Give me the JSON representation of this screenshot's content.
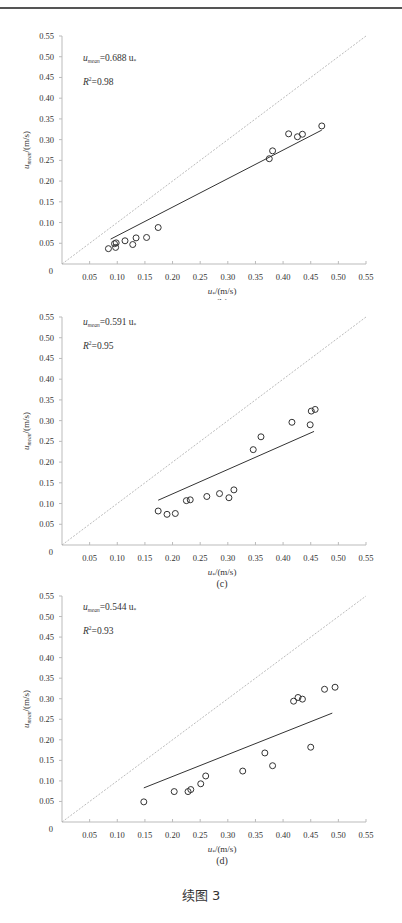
{
  "page": {
    "figure_caption": "续图 3"
  },
  "chart_data": [
    {
      "type": "scatter",
      "panel": "(b)",
      "title": "",
      "xlabel": "u*/(m/s)",
      "ylabel": "u_mean/(m/s)",
      "xlim": [
        0,
        0.55
      ],
      "ylim": [
        0,
        0.55
      ],
      "x_ticks": [
        "0.05",
        "0.10",
        "0.15",
        "0.20",
        "0.25",
        "0.30",
        "0.35",
        "0.40",
        "0.45",
        "0.50",
        "0.55"
      ],
      "y_ticks": [
        "0",
        "0.05",
        "0.10",
        "0.15",
        "0.20",
        "0.25",
        "0.30",
        "0.35",
        "0.40",
        "0.45",
        "0.50",
        "0.55"
      ],
      "annotations": {
        "equation_lhs": "u",
        "equation_sub": "mean",
        "equation_rhs": "=0.688 u",
        "equation_star": "*",
        "r2_label": "R",
        "r2_sup": "2",
        "r2_value": "=0.98"
      },
      "fit": {
        "slope": 0.688,
        "r2": 0.98,
        "x_start": 0.088,
        "y_start": 0.06,
        "x_end": 0.47,
        "y_end": 0.323
      },
      "reference_line": "1:1 dashed",
      "grid": false,
      "series": [
        {
          "name": "observed",
          "x": [
            0.084,
            0.097,
            0.098,
            0.095,
            0.114,
            0.128,
            0.134,
            0.153,
            0.174,
            0.375,
            0.381,
            0.41,
            0.426,
            0.435,
            0.47
          ],
          "y": [
            0.037,
            0.04,
            0.051,
            0.049,
            0.056,
            0.047,
            0.063,
            0.064,
            0.088,
            0.254,
            0.273,
            0.314,
            0.307,
            0.313,
            0.333
          ]
        }
      ]
    },
    {
      "type": "scatter",
      "panel": "(c)",
      "title": "",
      "xlabel": "u*/(m/s)",
      "ylabel": "u_mean/(m/s)",
      "xlim": [
        0,
        0.55
      ],
      "ylim": [
        0,
        0.55
      ],
      "x_ticks": [
        "0.05",
        "0.10",
        "0.15",
        "0.20",
        "0.25",
        "0.30",
        "0.35",
        "0.40",
        "0.45",
        "0.50",
        "0.55"
      ],
      "y_ticks": [
        "0",
        "0.05",
        "0.10",
        "0.15",
        "0.20",
        "0.25",
        "0.30",
        "0.35",
        "0.40",
        "0.45",
        "0.50",
        "0.55"
      ],
      "annotations": {
        "equation_lhs": "u",
        "equation_sub": "mean",
        "equation_rhs": "=0.591 u",
        "equation_star": "*",
        "r2_label": "R",
        "r2_sup": "2",
        "r2_value": "=0.95"
      },
      "fit": {
        "slope": 0.591,
        "r2": 0.95,
        "x_start": 0.174,
        "y_start": 0.108,
        "x_end": 0.456,
        "y_end": 0.274
      },
      "reference_line": "1:1 dashed",
      "grid": false,
      "series": [
        {
          "name": "observed",
          "x": [
            0.174,
            0.19,
            0.205,
            0.225,
            0.232,
            0.262,
            0.285,
            0.302,
            0.311,
            0.346,
            0.36,
            0.416,
            0.449,
            0.451,
            0.458
          ],
          "y": [
            0.082,
            0.074,
            0.076,
            0.107,
            0.109,
            0.117,
            0.124,
            0.114,
            0.133,
            0.23,
            0.261,
            0.296,
            0.29,
            0.323,
            0.327
          ]
        }
      ]
    },
    {
      "type": "scatter",
      "panel": "(d)",
      "title": "",
      "xlabel": "u*/(m/s)",
      "ylabel": "u_mean/(m/s)",
      "xlim": [
        0,
        0.55
      ],
      "ylim": [
        0,
        0.55
      ],
      "x_ticks": [
        "0.05",
        "0.10",
        "0.15",
        "0.20",
        "0.25",
        "0.30",
        "0.35",
        "0.40",
        "0.45",
        "0.50",
        "0.55"
      ],
      "y_ticks": [
        "0",
        "0.05",
        "0.10",
        "0.15",
        "0.20",
        "0.25",
        "0.30",
        "0.35",
        "0.40",
        "0.45",
        "0.50",
        "0.55"
      ],
      "annotations": {
        "equation_lhs": "u",
        "equation_sub": "mean",
        "equation_rhs": "=0.544 u",
        "equation_star": "*",
        "r2_label": "R",
        "r2_sup": "2",
        "r2_value": "=0.93"
      },
      "fit": {
        "slope": 0.544,
        "r2": 0.93,
        "x_start": 0.148,
        "y_start": 0.083,
        "x_end": 0.489,
        "y_end": 0.265
      },
      "reference_line": "1:1 dashed",
      "grid": false,
      "series": [
        {
          "name": "observed",
          "x": [
            0.148,
            0.203,
            0.228,
            0.233,
            0.251,
            0.26,
            0.327,
            0.367,
            0.381,
            0.419,
            0.427,
            0.435,
            0.45,
            0.475,
            0.494
          ],
          "y": [
            0.049,
            0.074,
            0.074,
            0.079,
            0.093,
            0.112,
            0.124,
            0.168,
            0.137,
            0.294,
            0.303,
            0.299,
            0.182,
            0.323,
            0.328
          ]
        }
      ]
    }
  ]
}
